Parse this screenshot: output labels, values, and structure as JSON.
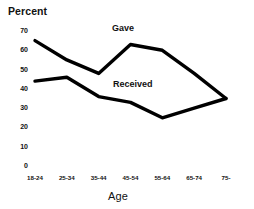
{
  "chart_data": {
    "type": "line",
    "title": "",
    "ylabel": "Percent",
    "xlabel": "Age",
    "categories": [
      "18-24",
      "25-34",
      "35-44",
      "45-54",
      "55-64",
      "65-74",
      "75-"
    ],
    "yticks": [
      0,
      10,
      20,
      30,
      40,
      50,
      60,
      70
    ],
    "ylim": [
      0,
      70
    ],
    "grid": false,
    "legend_position": "inline-annotation",
    "series": [
      {
        "name": "Gave",
        "values": [
          65,
          55,
          48,
          63,
          60,
          48,
          35
        ],
        "color": "#000000"
      },
      {
        "name": "Received",
        "values": [
          44,
          46,
          36,
          33,
          25,
          30,
          35
        ],
        "color": "#000000"
      }
    ],
    "annotations": [
      {
        "text": "Gave",
        "series": "Gave"
      },
      {
        "text": "Received",
        "series": "Received"
      }
    ]
  },
  "axes": {
    "y_title": "Percent",
    "x_title": "Age",
    "y_tick_labels": [
      "70",
      "60",
      "50",
      "40",
      "30",
      "20",
      "10",
      "0"
    ],
    "x_tick_labels": [
      "18-24",
      "25-34",
      "35-44",
      "45-54",
      "55-64",
      "65-74",
      "75-"
    ]
  },
  "labels": {
    "gave": "Gave",
    "received": "Received"
  },
  "style": {
    "line_color": "#000000",
    "background": "#ffffff",
    "text_color": "#111111"
  }
}
